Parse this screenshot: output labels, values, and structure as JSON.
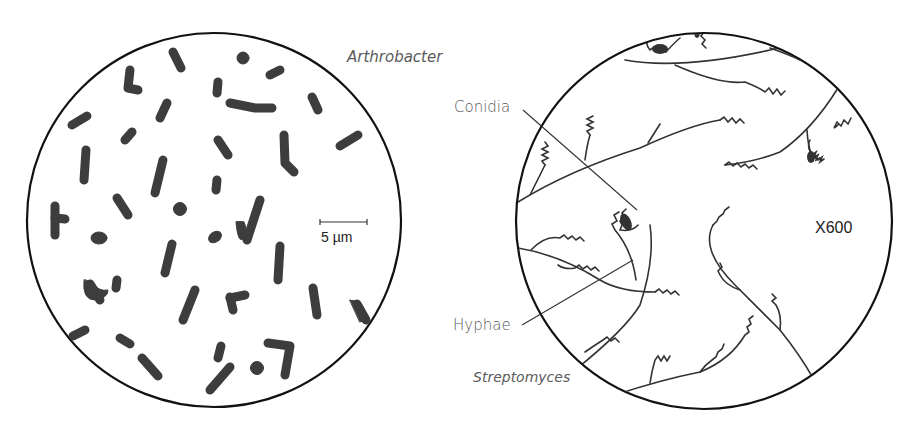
{
  "panels": [
    {
      "id": "arthrobacter",
      "title": "Arthrobacter",
      "scale_bar": "5 µm",
      "circle": {
        "cx": 214,
        "cy": 220,
        "r": 187
      }
    },
    {
      "id": "streptomyces",
      "title": "Streptomyces",
      "magnification": "X600",
      "labels": {
        "conidia": "Conidia",
        "hyphae": "Hyphae"
      },
      "circle": {
        "cx": 704,
        "cy": 221,
        "r": 188
      }
    }
  ],
  "colors": {
    "outline": "#111111",
    "cells": "#3d3d3d",
    "label": "#5a5a5a",
    "hyphae": "#333333"
  }
}
